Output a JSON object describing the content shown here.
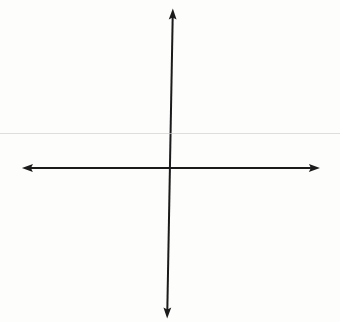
{
  "colors": {
    "background": "#fdfdfb",
    "grid_line": "#9f9f9f",
    "grid_border": "#8a8a8a",
    "axis": "#1b1b1b",
    "label": "#2b2b2b",
    "scan_artifact": "#cfcfca"
  },
  "chart_data": {
    "type": "scatter",
    "title": "",
    "xlabel": "x",
    "ylabel": "y",
    "xlim": [
      -10,
      10
    ],
    "ylim": [
      -10,
      10
    ],
    "grid": true,
    "grid_columns": 20,
    "grid_rows": 20,
    "cells_per_quadrant": 10,
    "axis_numbering_visible": false,
    "legend": null,
    "series": []
  }
}
